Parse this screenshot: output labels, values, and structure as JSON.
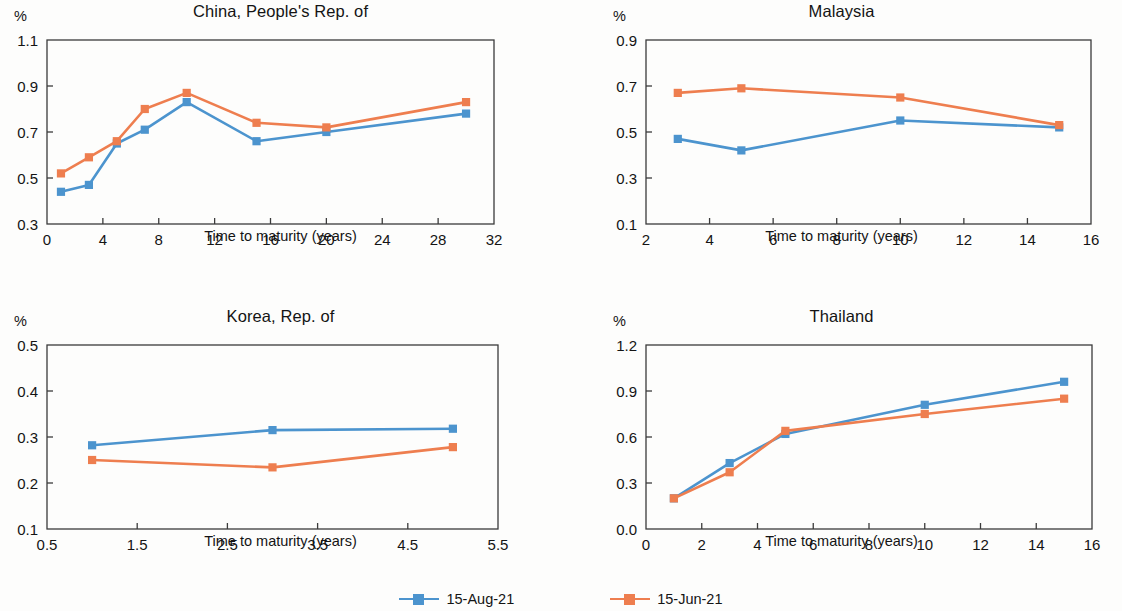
{
  "figure": {
    "axis_title": "Time to maturity (years)",
    "percent_symbol": "%",
    "colors": {
      "series_aug": "#4c94ce",
      "series_jun": "#ee7e4f",
      "axis": "#3b3b3b",
      "text": "#141414",
      "background": "#fdfdfc"
    }
  },
  "legend": {
    "position": "bottom-center",
    "items": [
      {
        "label": "15-Aug-21",
        "color": "#4c94ce",
        "marker": "square"
      },
      {
        "label": "15-Jun-21",
        "color": "#ee7e4f",
        "marker": "square"
      }
    ]
  },
  "chart_data": [
    {
      "id": "china",
      "type": "line",
      "title": "China, People's Rep. of",
      "xlabel": "Time to maturity (years)",
      "ylabel": "%",
      "xlim": [
        0,
        32
      ],
      "ylim": [
        0.3,
        1.1
      ],
      "xticks": [
        0,
        4,
        8,
        12,
        16,
        20,
        24,
        28,
        32
      ],
      "xtick_labels": [
        "0",
        "4",
        "8",
        "12",
        "16",
        "20",
        "24",
        "28",
        "32"
      ],
      "yticks": [
        0.3,
        0.5,
        0.7,
        0.9,
        1.1
      ],
      "ytick_labels": [
        "0.3",
        "0.5",
        "0.7",
        "0.9",
        "1.1"
      ],
      "grid": false,
      "x": [
        1,
        3,
        5,
        7,
        10,
        15,
        20,
        30
      ],
      "series": [
        {
          "name": "15-Aug-21",
          "color": "#4c94ce",
          "values": [
            0.44,
            0.47,
            0.65,
            0.71,
            0.83,
            0.66,
            0.7,
            0.78
          ]
        },
        {
          "name": "15-Jun-21",
          "color": "#ee7e4f",
          "values": [
            0.52,
            0.59,
            0.66,
            0.8,
            0.87,
            0.74,
            0.72,
            0.83
          ]
        }
      ]
    },
    {
      "id": "malaysia",
      "type": "line",
      "title": "Malaysia",
      "xlabel": "Time to maturity (years)",
      "ylabel": "%",
      "xlim": [
        2,
        16
      ],
      "ylim": [
        0.1,
        0.9
      ],
      "xticks": [
        2,
        4,
        6,
        8,
        10,
        12,
        14,
        16
      ],
      "xtick_labels": [
        "2",
        "4",
        "6",
        "8",
        "10",
        "12",
        "14",
        "16"
      ],
      "yticks": [
        0.1,
        0.3,
        0.5,
        0.7,
        0.9
      ],
      "ytick_labels": [
        "0.1",
        "0.3",
        "0.5",
        "0.7",
        "0.9"
      ],
      "grid": false,
      "x": [
        3,
        5,
        10,
        15
      ],
      "series": [
        {
          "name": "15-Aug-21",
          "color": "#4c94ce",
          "values": [
            0.47,
            0.42,
            0.55,
            0.52
          ]
        },
        {
          "name": "15-Jun-21",
          "color": "#ee7e4f",
          "values": [
            0.67,
            0.69,
            0.65,
            0.53
          ]
        }
      ]
    },
    {
      "id": "korea",
      "type": "line",
      "title": "Korea, Rep. of",
      "xlabel": "Time to maturity (years)",
      "ylabel": "%",
      "xlim": [
        0.5,
        5.5
      ],
      "ylim": [
        0.1,
        0.5
      ],
      "xticks": [
        0.5,
        1.5,
        2.5,
        3.5,
        4.5,
        5.5
      ],
      "xtick_labels": [
        "0.5",
        "1.5",
        "2.5",
        "3.5",
        "4.5",
        "5.5"
      ],
      "yticks": [
        0.1,
        0.2,
        0.3,
        0.4,
        0.5
      ],
      "ytick_labels": [
        "0.1",
        "0.2",
        "0.3",
        "0.4",
        "0.5"
      ],
      "grid": false,
      "x": [
        1,
        3,
        5
      ],
      "series": [
        {
          "name": "15-Aug-21",
          "color": "#4c94ce",
          "values": [
            0.282,
            0.315,
            0.318
          ]
        },
        {
          "name": "15-Jun-21",
          "color": "#ee7e4f",
          "values": [
            0.25,
            0.234,
            0.278
          ]
        }
      ]
    },
    {
      "id": "thailand",
      "type": "line",
      "title": "Thailand",
      "xlabel": "Time to maturity (years)",
      "ylabel": "%",
      "xlim": [
        0,
        16
      ],
      "ylim": [
        0.0,
        1.2
      ],
      "xticks": [
        0,
        2,
        4,
        6,
        8,
        10,
        12,
        14,
        16
      ],
      "xtick_labels": [
        "0",
        "2",
        "4",
        "6",
        "8",
        "10",
        "12",
        "14",
        "16"
      ],
      "yticks": [
        0.0,
        0.3,
        0.6,
        0.9,
        1.2
      ],
      "ytick_labels": [
        "0.0",
        "0.3",
        "0.6",
        "0.9",
        "1.2"
      ],
      "grid": false,
      "x": [
        1,
        3,
        5,
        10,
        15
      ],
      "series": [
        {
          "name": "15-Aug-21",
          "color": "#4c94ce",
          "values": [
            0.2,
            0.43,
            0.62,
            0.81,
            0.96
          ]
        },
        {
          "name": "15-Jun-21",
          "color": "#ee7e4f",
          "values": [
            0.2,
            0.37,
            0.64,
            0.75,
            0.85
          ]
        }
      ]
    }
  ]
}
